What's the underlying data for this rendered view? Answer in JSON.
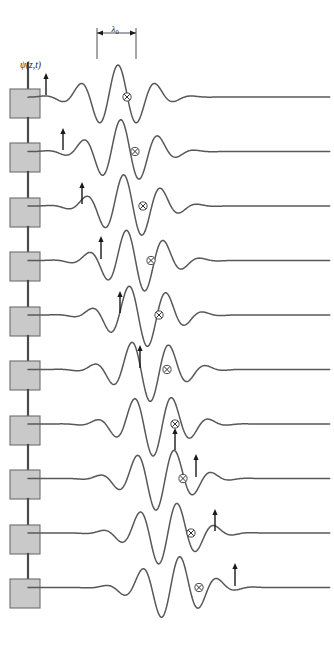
{
  "figure": {
    "title_label": "",
    "amplitude_label": "ψ(z,t)",
    "wavelength_label": "λ",
    "wavelength_subscript": "0",
    "phase_marker_icon": "circled-x-icon",
    "phase_velocity_arrow_icon": "up-arrow-icon",
    "source_box_icon": "oscillator-box-icon",
    "source_rod_icon": "vertical-rod-icon",
    "background_color": "#ffffff",
    "wave_stroke_color": "#58585a",
    "box_fill_color": "#c9c9c9",
    "box_stroke_color": "#6d6d6f",
    "marker_color": "#2f2f31"
  },
  "chart_data": {
    "type": "line",
    "title": "",
    "xlabel": "",
    "ylabel": "ψ(z,t)",
    "annotations": [
      {
        "name": "wavelength-dimension",
        "label": "λ₀",
        "x_start": 97,
        "x_end": 136,
        "y": 33
      },
      {
        "name": "amplitude-axis-label",
        "label": "ψ(z,t)",
        "x": 20,
        "y": 68
      }
    ],
    "layout": {
      "rows": 10,
      "row_spacing": 54.5,
      "first_baseline_y": 97,
      "axis_x_start": 28,
      "axis_x_end": 330,
      "grid": false,
      "legend": null
    },
    "series": [
      {
        "name": "row-1",
        "baseline_y": 97,
        "packet_center": 118,
        "packet_width": 56,
        "wavelength": 38,
        "amplitude": 32,
        "phase_offset": 0.0,
        "x_marker": 127,
        "arrow": {
          "x": 46,
          "y_tip": 73,
          "y_tail": 95,
          "above": true
        },
        "tail_end": 200
      },
      {
        "name": "row-2",
        "baseline_y": 151.5,
        "packet_center": 124,
        "packet_width": 56,
        "wavelength": 38,
        "amplitude": 32,
        "phase_offset": 0.55,
        "x_marker": 135,
        "arrow": {
          "x": 63,
          "y_tip": 128,
          "y_tail": 150,
          "above": true
        },
        "tail_end": 206
      },
      {
        "name": "row-3",
        "baseline_y": 206,
        "packet_center": 130,
        "packet_width": 56,
        "wavelength": 38,
        "amplitude": 32,
        "phase_offset": 1.1,
        "x_marker": 143,
        "arrow": {
          "x": 82,
          "y_tip": 182,
          "y_tail": 204,
          "above": true
        },
        "tail_end": 212
      },
      {
        "name": "row-4",
        "baseline_y": 260.5,
        "packet_center": 136,
        "packet_width": 56,
        "wavelength": 38,
        "amplitude": 32,
        "phase_offset": 1.65,
        "x_marker": 151,
        "arrow": {
          "x": 101,
          "y_tip": 236,
          "y_tail": 259,
          "above": true
        },
        "tail_end": 218
      },
      {
        "name": "row-5",
        "baseline_y": 315,
        "packet_center": 142,
        "packet_width": 56,
        "wavelength": 38,
        "amplitude": 32,
        "phase_offset": 2.2,
        "x_marker": 159,
        "arrow": {
          "x": 120,
          "y_tip": 291,
          "y_tail": 313,
          "above": true
        },
        "tail_end": 224
      },
      {
        "name": "row-6",
        "baseline_y": 369.5,
        "packet_center": 148,
        "packet_width": 56,
        "wavelength": 38,
        "amplitude": 32,
        "phase_offset": 2.75,
        "x_marker": 167,
        "arrow": {
          "x": 140,
          "y_tip": 345,
          "y_tail": 368,
          "above": true
        },
        "tail_end": 230
      },
      {
        "name": "row-7",
        "baseline_y": 424,
        "packet_center": 154,
        "packet_width": 56,
        "wavelength": 38,
        "amplitude": 32,
        "phase_offset": 3.3,
        "x_marker": 175,
        "arrow": {
          "x": 175,
          "y_tip": 428,
          "y_tail": 450,
          "above": false
        },
        "tail_end": 236
      },
      {
        "name": "row-8",
        "baseline_y": 478.5,
        "packet_center": 160,
        "packet_width": 56,
        "wavelength": 38,
        "amplitude": 32,
        "phase_offset": 3.85,
        "x_marker": 183,
        "arrow": {
          "x": 196,
          "y_tip": 454,
          "y_tail": 477,
          "above": true
        },
        "tail_end": 242
      },
      {
        "name": "row-9",
        "baseline_y": 533,
        "packet_center": 166,
        "packet_width": 56,
        "wavelength": 38,
        "amplitude": 32,
        "phase_offset": 4.4,
        "x_marker": 191,
        "arrow": {
          "x": 215,
          "y_tip": 509,
          "y_tail": 531,
          "above": true
        },
        "tail_end": 248
      },
      {
        "name": "row-10",
        "baseline_y": 587.5,
        "packet_center": 172,
        "packet_width": 56,
        "wavelength": 38,
        "amplitude": 32,
        "phase_offset": 4.95,
        "x_marker": 199,
        "arrow": {
          "x": 235,
          "y_tip": 563,
          "y_tail": 586,
          "above": true
        },
        "tail_end": 254
      }
    ],
    "sources": [
      {
        "name": "source-1",
        "box_x": 10,
        "box_y": 89,
        "box_w": 30,
        "box_h": 29,
        "rod_x": 28,
        "rod_top": 63
      },
      {
        "name": "source-2",
        "box_x": 10,
        "box_y": 143,
        "box_w": 30,
        "box_h": 29,
        "rod_x": 28,
        "rod_top": 118
      },
      {
        "name": "source-3",
        "box_x": 10,
        "box_y": 198,
        "box_w": 30,
        "box_h": 29,
        "rod_x": 28,
        "rod_top": 172
      },
      {
        "name": "source-4",
        "box_x": 10,
        "box_y": 252,
        "box_w": 30,
        "box_h": 29,
        "rod_x": 28,
        "rod_top": 227
      },
      {
        "name": "source-5",
        "box_x": 10,
        "box_y": 307,
        "box_w": 30,
        "box_h": 29,
        "rod_x": 28,
        "rod_top": 281
      },
      {
        "name": "source-6",
        "box_x": 10,
        "box_y": 361,
        "box_w": 30,
        "box_h": 29,
        "rod_x": 28,
        "rod_top": 336
      },
      {
        "name": "source-7",
        "box_x": 10,
        "box_y": 416,
        "box_w": 30,
        "box_h": 29,
        "rod_x": 28,
        "rod_top": 390
      },
      {
        "name": "source-8",
        "box_x": 10,
        "box_y": 470,
        "box_w": 30,
        "box_h": 29,
        "rod_x": 28,
        "rod_top": 445
      },
      {
        "name": "source-9",
        "box_x": 10,
        "box_y": 525,
        "box_w": 30,
        "box_h": 29,
        "rod_x": 28,
        "rod_top": 499
      },
      {
        "name": "source-10",
        "box_x": 10,
        "box_y": 579,
        "box_w": 30,
        "box_h": 29,
        "rod_x": 28,
        "rod_top": 554
      }
    ]
  }
}
